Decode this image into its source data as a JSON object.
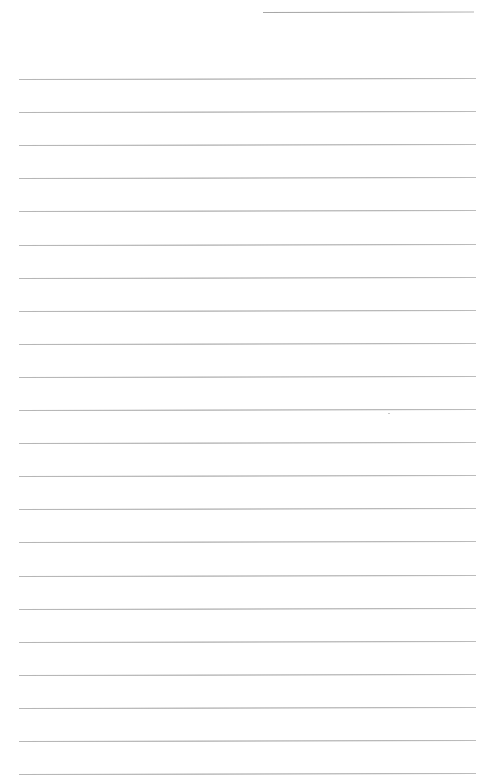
{
  "document": {
    "type": "lined-paper",
    "background_color": "#ffffff",
    "rule_color": "#a0a0a0",
    "header_rule": {
      "x_start": 263,
      "x_end": 474,
      "y": 12
    },
    "body_rules": {
      "x_start": 19,
      "x_end": 476,
      "first_y": 79,
      "spacing": 33.1,
      "count": 22
    },
    "text_content": []
  }
}
